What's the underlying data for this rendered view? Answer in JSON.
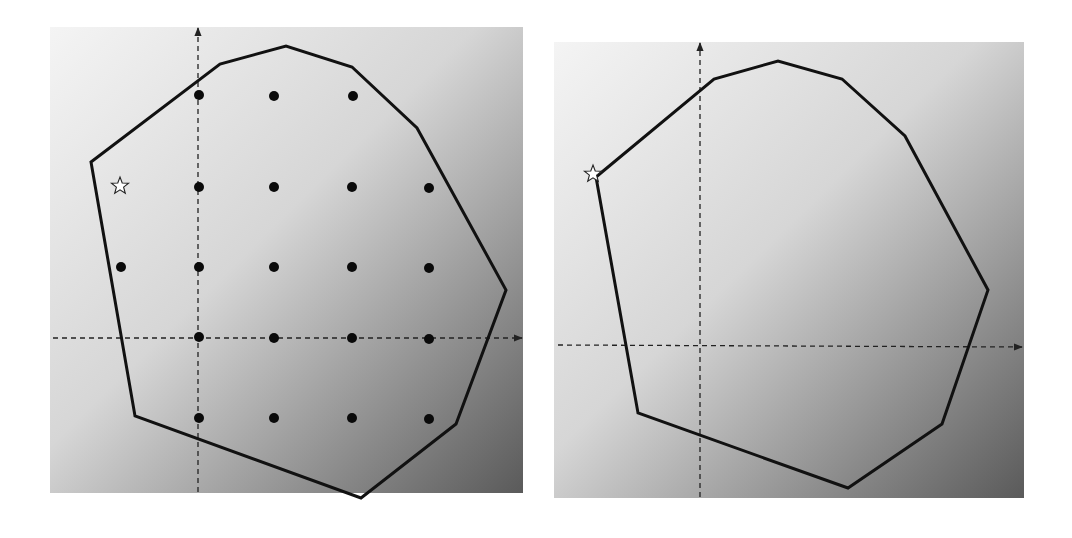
{
  "figure": {
    "colors": {
      "gradient_light": "#f4f4f4",
      "gradient_dark": "#5a5a5a",
      "polygon_stroke": "#111111",
      "axis_stroke": "#222222",
      "dot_fill": "#0a0a0a",
      "star_fill": "#ffffff",
      "star_stroke": "#222222"
    },
    "panels": [
      {
        "id": "left",
        "bounds": {
          "x": 50,
          "y": 27,
          "w": 473,
          "h": 466
        },
        "axes": {
          "origin": [
            198,
            338
          ],
          "x_axis": {
            "from": [
              53,
              338
            ],
            "to": [
              522,
              338
            ],
            "style": "dashed",
            "arrow": "right"
          },
          "y_axis": {
            "from": [
              198,
              492
            ],
            "to": [
              198,
              28
            ],
            "style": "dashed",
            "arrow": "up"
          }
        },
        "polygon": [
          [
            91,
            162
          ],
          [
            220,
            64
          ],
          [
            286,
            46
          ],
          [
            352,
            67
          ],
          [
            417,
            128
          ],
          [
            506,
            290
          ],
          [
            456,
            424
          ],
          [
            361,
            498
          ],
          [
            135,
            416
          ]
        ],
        "lattice_points": [
          [
            199,
            95
          ],
          [
            274,
            96
          ],
          [
            353,
            96
          ],
          [
            199,
            187
          ],
          [
            274,
            187
          ],
          [
            352,
            187
          ],
          [
            429,
            188
          ],
          [
            121,
            267
          ],
          [
            199,
            267
          ],
          [
            274,
            267
          ],
          [
            352,
            267
          ],
          [
            429,
            268
          ],
          [
            199,
            337
          ],
          [
            274,
            338
          ],
          [
            352,
            338
          ],
          [
            429,
            339
          ],
          [
            199,
            418
          ],
          [
            274,
            418
          ],
          [
            352,
            418
          ],
          [
            429,
            419
          ]
        ],
        "star": {
          "x": 120,
          "y": 186,
          "label": "star-marker"
        }
      },
      {
        "id": "right",
        "bounds": {
          "x": 554,
          "y": 42,
          "w": 470,
          "h": 456
        },
        "axes": {
          "origin": [
            700,
            345
          ],
          "x_axis": {
            "from": [
              558,
              345
            ],
            "to": [
              1022,
              347
            ],
            "style": "dashed",
            "arrow": "right"
          },
          "y_axis": {
            "from": [
              700,
              497
            ],
            "to": [
              700,
              43
            ],
            "style": "dashed",
            "arrow": "up"
          }
        },
        "polygon": [
          [
            596,
            177
          ],
          [
            714,
            79
          ],
          [
            778,
            61
          ],
          [
            842,
            79
          ],
          [
            905,
            136
          ],
          [
            988,
            290
          ],
          [
            942,
            424
          ],
          [
            848,
            488
          ],
          [
            638,
            413
          ]
        ],
        "star": {
          "x": 593,
          "y": 174,
          "label": "star-marker"
        }
      }
    ]
  }
}
